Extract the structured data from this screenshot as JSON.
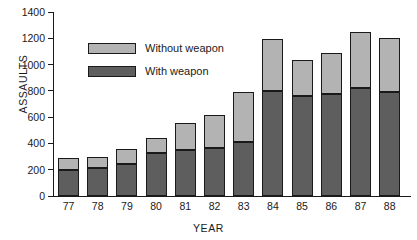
{
  "chart_data": {
    "type": "bar",
    "subtype": "stacked-bar",
    "title": "",
    "xlabel": "YEAR",
    "ylabel": "ASSAULTS",
    "ylim": [
      0,
      1400
    ],
    "ytick_step": 200,
    "yticks": [
      "1400",
      "1200",
      "1000",
      "800",
      "600",
      "400",
      "200",
      "0"
    ],
    "grid": false,
    "legend_position": "inside-upper-left",
    "categories": [
      "77",
      "78",
      "79",
      "80",
      "81",
      "82",
      "83",
      "84",
      "85",
      "86",
      "87",
      "88"
    ],
    "series": [
      {
        "name": "With weapon",
        "color": "#5e5e5e",
        "values": [
          200,
          210,
          240,
          330,
          350,
          365,
          410,
          800,
          760,
          775,
          820,
          790
        ]
      },
      {
        "name": "Without weapon",
        "color": "#b3b3b3",
        "values": [
          90,
          85,
          120,
          110,
          205,
          255,
          380,
          395,
          275,
          315,
          430,
          415
        ]
      }
    ],
    "totals": [
      290,
      295,
      360,
      440,
      555,
      620,
      790,
      1195,
      1035,
      1090,
      1250,
      1205
    ]
  },
  "legend": {
    "items": [
      {
        "label": "Without weapon",
        "swatch": "without"
      },
      {
        "label": "With weapon",
        "swatch": "with"
      }
    ]
  },
  "colors": {
    "without_weapon": "#b3b3b3",
    "with_weapon": "#5e5e5e",
    "axis": "#1a1a1a",
    "background": "#ffffff"
  }
}
